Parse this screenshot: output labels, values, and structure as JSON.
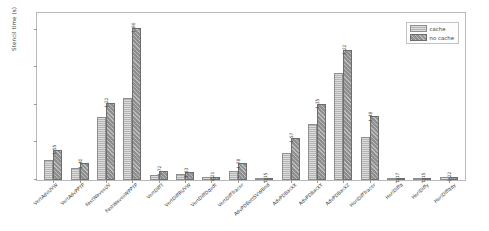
{
  "chart_data": {
    "type": "bar",
    "title": "",
    "xlabel": "",
    "ylabel": "Stencil time (s)",
    "ylim": [
      0,
      0.45
    ],
    "yticks": [
      "0.0",
      "0.1",
      "0.2",
      "0.3",
      "0.4"
    ],
    "ytick_values": [
      0.0,
      0.1,
      0.2,
      0.3,
      0.4
    ],
    "grid": false,
    "legend_position": "upper right",
    "categories": [
      "VertAdvUVW",
      "VertAdvPPTP",
      "FastWavesUV",
      "FastWavesWPPTP",
      "VertDiffT",
      "VertDiffRUVW",
      "VertDiffDqvdt",
      "VertDiffTracer",
      "AdvPDBottSVWBnd",
      "AdvPDBackX",
      "AdvPDBackY",
      "AdvPDBackZ",
      "HoriDiffTracer",
      "HoriDiffq",
      "HoriDiffy",
      "HoriDiffqqy"
    ],
    "series": [
      {
        "name": "cache",
        "color": "#b4b4b4",
        "values": [
          0.052,
          0.031,
          0.168,
          0.218,
          0.014,
          0.016,
          0.007,
          0.025,
          0.005,
          0.071,
          0.15,
          0.284,
          0.115,
          0.004,
          0.003,
          0.007
        ]
      },
      {
        "name": "no cache",
        "color": "#8f8f8f",
        "values": [
          0.081,
          0.044,
          0.205,
          0.406,
          0.024,
          0.021,
          0.009,
          0.045,
          0.006,
          0.112,
          0.203,
          0.347,
          0.17,
          0.005,
          0.003,
          0.009
        ]
      }
    ],
    "ratio_labels": [
      "1.55",
      "1.40",
      "1.22",
      "1.86",
      "1.72",
      "1.33",
      "1.21",
      "1.78",
      "1.15",
      "1.57",
      "1.35",
      "1.22",
      "1.48",
      "1.17",
      "1.15",
      "1.22"
    ]
  },
  "legend": {
    "items": [
      {
        "label": "cache",
        "key": "cache"
      },
      {
        "label": "no cache",
        "key": "nocache"
      }
    ]
  }
}
